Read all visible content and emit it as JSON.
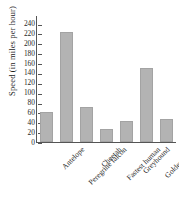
{
  "chart_data": {
    "type": "bar",
    "title": "",
    "xlabel": "",
    "ylabel": "Speed (in miles per hour)",
    "categories": [
      "Antelope",
      "Peregrine falcon",
      "Cheetah",
      "Fastest human",
      "Greyhound",
      "Golden eagle",
      "Grant's gazelle"
    ],
    "values": [
      61,
      222,
      70,
      27,
      42,
      150,
      46
    ],
    "ylim": [
      0,
      250
    ],
    "yticks": [
      0,
      20,
      40,
      60,
      80,
      100,
      120,
      140,
      160,
      180,
      200,
      220,
      240
    ],
    "ytick_labels": [
      "0",
      "20",
      "40",
      "60",
      "80",
      "100",
      "120",
      "140",
      "160",
      "180",
      "200",
      "220",
      "240"
    ],
    "grid": false,
    "legend": false,
    "bar_color": "#b3b3b3",
    "axis_color": "#555555",
    "text_color": "#1f1f1f"
  }
}
